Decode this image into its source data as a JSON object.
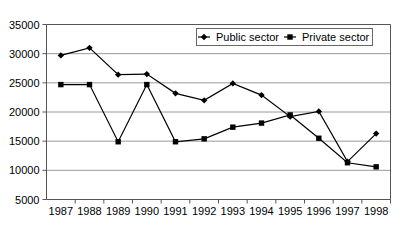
{
  "chart_data": {
    "type": "line",
    "title": "",
    "subtitle": "",
    "xlabel": "",
    "ylabel": "",
    "categories": [
      "1987",
      "1988",
      "1989",
      "1990",
      "1991",
      "1992",
      "1993",
      "1994",
      "1995",
      "1996",
      "1997",
      "1998"
    ],
    "ylim": [
      5000,
      35000
    ],
    "ytick_labels": [
      "35000",
      "30000",
      "25000",
      "20000",
      "15000",
      "10000",
      "5000"
    ],
    "ytick_values": [
      35000,
      30000,
      25000,
      20000,
      15000,
      10000,
      5000
    ],
    "grid": true,
    "legend_position": "top-right",
    "series": [
      {
        "name": "Public sector",
        "marker": "diamond",
        "color": "#000000",
        "values": [
          29700,
          31000,
          26400,
          26500,
          23200,
          22000,
          24900,
          22900,
          19200,
          20100,
          11500,
          16300
        ]
      },
      {
        "name": "Private sector",
        "marker": "square",
        "color": "#000000",
        "values": [
          24700,
          24700,
          14900,
          24700,
          14900,
          15400,
          17400,
          18100,
          19500,
          15500,
          11300,
          10600
        ]
      }
    ]
  },
  "legend": {
    "entries": [
      {
        "label": "Public sector"
      },
      {
        "label": "Private sector"
      }
    ]
  }
}
